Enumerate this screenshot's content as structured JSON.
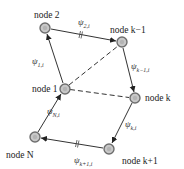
{
  "diagram": {
    "type": "ring-network",
    "nodes": [
      {
        "id": "n2",
        "label": "node 2",
        "x": 45,
        "y": 28
      },
      {
        "id": "nkm1",
        "label": "node k−1",
        "x": 122,
        "y": 42
      },
      {
        "id": "n1",
        "label": "node 1",
        "x": 65,
        "y": 89
      },
      {
        "id": "nk",
        "label": "node k",
        "x": 135,
        "y": 98
      },
      {
        "id": "nN",
        "label": "node N",
        "x": 35,
        "y": 137
      },
      {
        "id": "nkp1",
        "label": "node k+1",
        "x": 109,
        "y": 149
      }
    ],
    "edges": [
      {
        "from": "n1",
        "to": "n2",
        "style": "solid",
        "arrow": true,
        "label": "ψ",
        "sub": "1,i"
      },
      {
        "from": "n2",
        "to": "nkm1",
        "style": "solid",
        "arrow": true,
        "label": "ψ",
        "sub": "2,i",
        "break": true
      },
      {
        "from": "nkm1",
        "to": "nk",
        "style": "solid",
        "arrow": true,
        "label": "ψ",
        "sub": "k−1,i"
      },
      {
        "from": "nk",
        "to": "nkp1",
        "style": "solid",
        "arrow": true,
        "label": "ψ",
        "sub": "k,i"
      },
      {
        "from": "nkp1",
        "to": "nN",
        "style": "solid",
        "arrow": true,
        "label": "ψ",
        "sub": "k+1,i",
        "break": true
      },
      {
        "from": "nN",
        "to": "n1",
        "style": "solid",
        "arrow": true,
        "label": "ψ",
        "sub": "N,i"
      },
      {
        "from": "n1",
        "to": "nkm1",
        "style": "dashed",
        "arrow": false
      },
      {
        "from": "n1",
        "to": "nk",
        "style": "dashed",
        "arrow": false
      }
    ],
    "colors": {
      "node_fill": "#c8c8c8",
      "node_stroke": "#6e6e6e",
      "edge": "#333333"
    }
  }
}
